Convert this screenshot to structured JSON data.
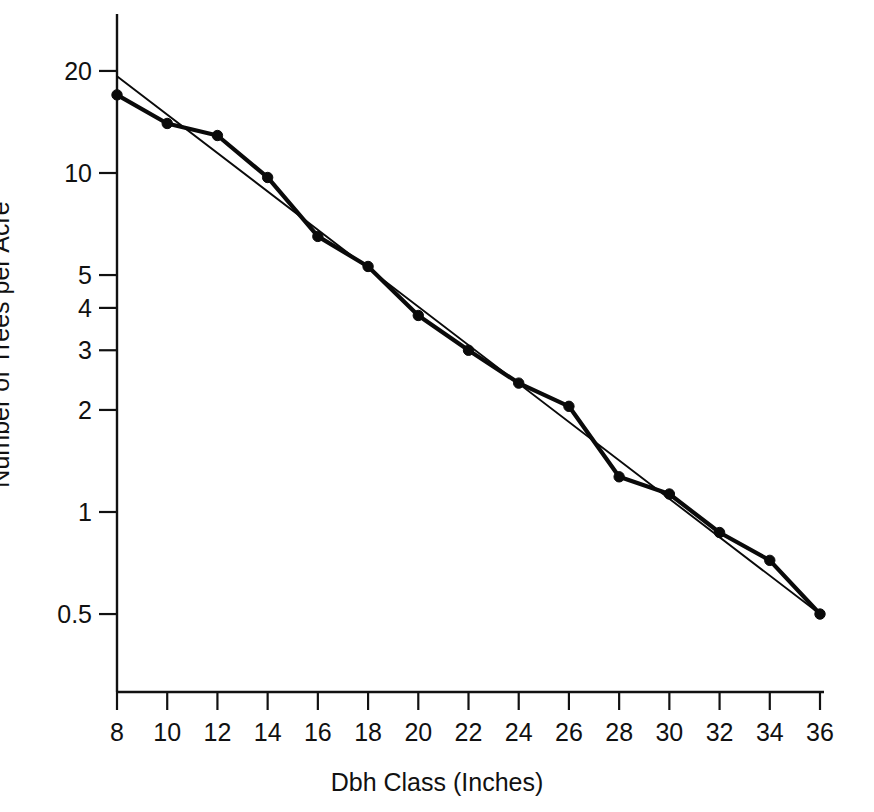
{
  "figure": {
    "background_color": "#ffffff",
    "ink_color": "#0a0a0a"
  },
  "chart_data": {
    "type": "line",
    "title": "",
    "xlabel": "Dbh Class (Inches)",
    "ylabel": "Number of Trees per Acre",
    "yscale": "log",
    "xscale": "linear",
    "xlim": [
      8,
      36
    ],
    "ylim": [
      0.38,
      24
    ],
    "grid": false,
    "legend": "none",
    "xticks": [
      8,
      10,
      12,
      14,
      16,
      18,
      20,
      22,
      24,
      26,
      28,
      30,
      32,
      34,
      36
    ],
    "xtick_labels": [
      "8",
      "10",
      "12",
      "14",
      "16",
      "18",
      "20",
      "22",
      "24",
      "26",
      "28",
      "30",
      "32",
      "34",
      "36"
    ],
    "yticks": [
      20,
      10,
      5,
      4,
      3,
      2,
      1,
      0.5
    ],
    "ytick_labels": [
      "20",
      "10",
      "5",
      "4",
      "3",
      "2",
      "1",
      "0.5"
    ],
    "x": [
      8,
      10,
      12,
      14,
      16,
      18,
      20,
      22,
      24,
      26,
      28,
      30,
      32,
      34,
      36
    ],
    "series": [
      {
        "name": "Observed stand table",
        "style": "line-with-markers",
        "marker": "circle",
        "linewidth": 4.2,
        "values": [
          17.0,
          14.0,
          12.9,
          9.7,
          6.5,
          5.3,
          3.8,
          3.0,
          2.4,
          2.05,
          1.27,
          1.13,
          0.87,
          0.72,
          0.5
        ]
      },
      {
        "name": "Fitted negative exponential",
        "style": "line",
        "marker": "none",
        "linewidth": 1.9,
        "x": [
          8,
          36
        ],
        "values": [
          19.3,
          0.5
        ]
      }
    ]
  }
}
